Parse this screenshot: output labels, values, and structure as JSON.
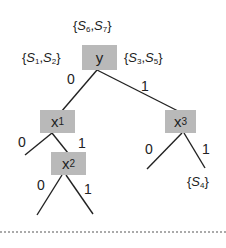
{
  "diagram": {
    "type": "decision-tree",
    "node_fill": "#b9b9b9",
    "edge_color": "#222222",
    "nodes": [
      {
        "id": "y",
        "label": "y",
        "var": "y",
        "sub": ""
      },
      {
        "id": "x1",
        "label": "x1",
        "var": "x",
        "sub": "1"
      },
      {
        "id": "x2",
        "label": "x2",
        "var": "x",
        "sub": "2"
      },
      {
        "id": "x3",
        "label": "x3",
        "var": "x",
        "sub": "3"
      }
    ],
    "edges": [
      {
        "from": "y",
        "to": "x1",
        "label": "0"
      },
      {
        "from": "y",
        "to": "x3",
        "label": "1"
      },
      {
        "from": "x1",
        "to": "leaf-x1-0",
        "label": "0"
      },
      {
        "from": "x1",
        "to": "x2",
        "label": "1"
      },
      {
        "from": "x2",
        "to": "leaf-x2-0",
        "label": "0"
      },
      {
        "from": "x2",
        "to": "leaf-x2-1",
        "label": "1"
      },
      {
        "from": "x3",
        "to": "leaf-x3-0",
        "label": "0"
      },
      {
        "from": "x3",
        "to": "leaf-x3-1",
        "label": "1"
      }
    ],
    "sets": {
      "top": {
        "text": "{S6,S7}",
        "a": "S",
        "a_sub": "6",
        "b": "S",
        "b_sub": "7"
      },
      "left": {
        "text": "{S1,S2}",
        "a": "S",
        "a_sub": "1",
        "b": "S",
        "b_sub": "2"
      },
      "right": {
        "text": "{S3,S5}",
        "a": "S",
        "a_sub": "3",
        "b": "S",
        "b_sub": "5"
      },
      "leaf": {
        "text": "{S4}",
        "a": "S",
        "a_sub": "4"
      }
    },
    "edge_labels": {
      "y_0": "0",
      "y_1": "1",
      "x1_0": "0",
      "x1_1": "1",
      "x2_0": "0",
      "x2_1": "1",
      "x3_0": "0",
      "x3_1": "1"
    },
    "separator": "dotted"
  }
}
